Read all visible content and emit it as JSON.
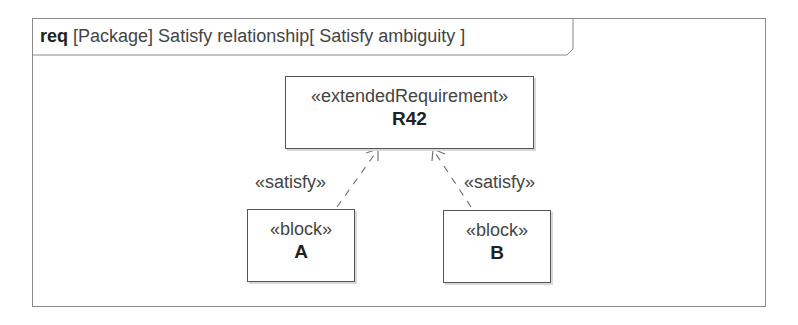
{
  "diagram": {
    "frame": {
      "kind": "req",
      "element_type": "[Package]",
      "name": "Satisfy relationship",
      "diagram_name": "[ Satisfy ambiguity ]"
    },
    "requirement": {
      "stereotype": "«extendedRequirement»",
      "name": "R42"
    },
    "blocks": [
      {
        "stereotype": "«block»",
        "name": "A"
      },
      {
        "stereotype": "«block»",
        "name": "B"
      }
    ],
    "relationships": [
      {
        "label": "«satisfy»",
        "from": "A",
        "to": "R42",
        "style": "dashed-open-arrow"
      },
      {
        "label": "«satisfy»",
        "from": "B",
        "to": "R42",
        "style": "dashed-open-arrow"
      }
    ],
    "colors": {
      "frame_border": "#8a8a8a",
      "box_border": "#555555",
      "line": "#777777",
      "text": "#222222"
    }
  }
}
